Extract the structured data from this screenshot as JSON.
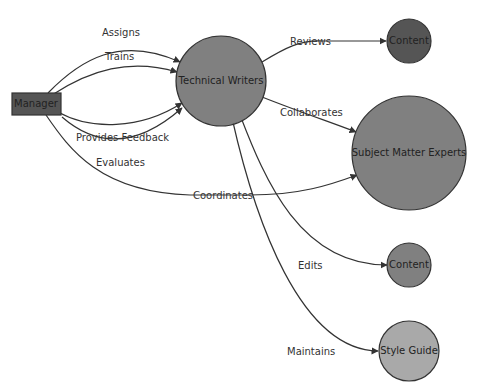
{
  "diagram": {
    "type": "flowchart",
    "nodes": [
      {
        "id": "manager",
        "label": "Manager",
        "shape": "rect",
        "color": "#555555"
      },
      {
        "id": "tw",
        "label": "Technical Writers",
        "shape": "circle",
        "color": "#808080"
      },
      {
        "id": "content1",
        "label": "Content",
        "shape": "circle",
        "color": "#555555"
      },
      {
        "id": "sme",
        "label": "Subject Matter Experts",
        "shape": "circle",
        "color": "#808080"
      },
      {
        "id": "content2",
        "label": "Content",
        "shape": "circle",
        "color": "#808080"
      },
      {
        "id": "style",
        "label": "Style Guide",
        "shape": "circle",
        "color": "#a9a9a9"
      }
    ],
    "edges": [
      {
        "from": "manager",
        "to": "tw",
        "label": "Assigns"
      },
      {
        "from": "manager",
        "to": "tw",
        "label": "Trains"
      },
      {
        "from": "manager",
        "to": "tw",
        "label": "Provides Feedback"
      },
      {
        "from": "manager",
        "to": "tw",
        "label": "Evaluates"
      },
      {
        "from": "manager",
        "to": "sme",
        "label": "Coordinates"
      },
      {
        "from": "tw",
        "to": "content1",
        "label": "Reviews"
      },
      {
        "from": "tw",
        "to": "sme",
        "label": "Collaborates"
      },
      {
        "from": "tw",
        "to": "content2",
        "label": "Edits"
      },
      {
        "from": "tw",
        "to": "style",
        "label": "Maintains"
      }
    ]
  }
}
